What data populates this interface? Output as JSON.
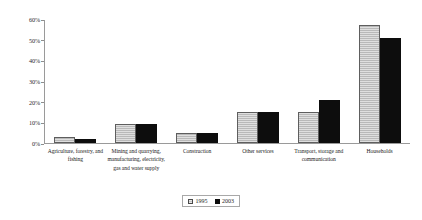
{
  "chart_data": {
    "type": "bar",
    "title": "",
    "subtitle": "",
    "xlabel": "",
    "ylabel": "",
    "ylim": [
      0,
      60
    ],
    "ytick_labels": [
      "0%",
      "10%",
      "20%",
      "30%",
      "40%",
      "50%",
      "60%"
    ],
    "ytick_values": [
      0,
      10,
      20,
      30,
      40,
      50,
      60
    ],
    "grid": false,
    "legend_position": "bottom-center",
    "categories": [
      "Agriculture, forestry, and fishing",
      "Mining and quarrying, manufacturing, electricity, gas and water supply",
      "Construction",
      "Other services",
      "Transport, storage and communication",
      "Households"
    ],
    "series": [
      {
        "name": "1995",
        "color": "#b9b9b9",
        "values": [
          3,
          9,
          5,
          15,
          15,
          57
        ]
      },
      {
        "name": "2003",
        "color": "#0d0d0d",
        "values": [
          2,
          9,
          5,
          15,
          21,
          51
        ]
      }
    ]
  },
  "legend": {
    "entries": [
      {
        "label": "1995",
        "swatch": "legend-swatch-1995"
      },
      {
        "label": "2003",
        "swatch": "legend-swatch-2003"
      }
    ]
  }
}
